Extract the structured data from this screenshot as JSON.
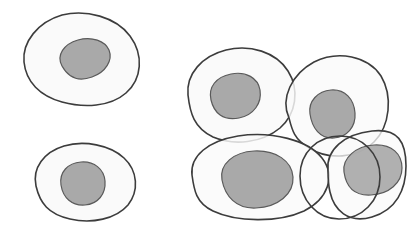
{
  "figure": {
    "background_color": "#ffffff",
    "width": 411,
    "height": 228
  },
  "style": {
    "membrane_stroke": "#3c3c3c",
    "membrane_stroke_width": 1.6,
    "cytoplasm_fill": "#fafafa",
    "nucleus_fill": "#a9a9a9",
    "nucleus_stroke": "#5a5a5a",
    "nucleus_stroke_width": 1.2
  },
  "groups": [
    {
      "name": "isolated-cells",
      "label": "Isolated cells",
      "count": 2
    },
    {
      "name": "cell-cluster",
      "label": "Overlapping cell cluster",
      "count": 5
    }
  ],
  "cells": [
    {
      "id": "cell-1",
      "group": "isolated-cells",
      "label": "Upper left cell",
      "membrane_path": "M 24 62 C 22 42 38 22 62 15 C 86 9 116 17 130 36 C 144 55 142 79 126 93 C 110 107 84 108 62 102 C 40 96 26 82 24 62 Z",
      "nucleus_path": "M 62 66 C 56 55 64 44 78 40 C 92 36 105 41 109 50 C 113 60 106 72 92 77 C 78 82 68 77 62 66 Z",
      "nucleus_shape": "tilted-ellipse"
    },
    {
      "id": "cell-2",
      "group": "isolated-cells",
      "label": "Lower left cell",
      "membrane_path": "M 36 186 C 32 168 44 152 64 146 C 84 140 110 145 124 158 C 138 171 139 191 128 205 C 116 219 92 224 70 219 C 48 214 40 203 36 186 Z",
      "nucleus_path": "M 61 185 C 59 172 68 163 81 162 C 94 161 104 169 105 181 C 106 194 98 204 85 205 C 72 206 63 198 61 185 Z",
      "nucleus_shape": "round"
    },
    {
      "id": "cell-3",
      "group": "cell-cluster",
      "label": "Cluster upper left cell",
      "membrane_path": "M 188 95 C 186 74 202 56 226 50 C 250 44 276 52 288 71 C 300 90 296 114 280 128 C 262 143 234 146 213 137 C 194 128 190 113 188 95 Z",
      "nucleus_path": "M 211 100 C 208 87 216 77 231 74 C 246 71 258 78 260 90 C 262 103 254 115 239 118 C 223 121 214 113 211 100 Z",
      "nucleus_shape": "rounded-square"
    },
    {
      "id": "cell-4",
      "group": "cell-cluster",
      "label": "Cluster upper right cell",
      "membrane_path": "M 289 118 C 280 98 292 74 314 62 C 338 50 368 56 381 76 C 393 96 390 126 374 142 C 357 159 328 160 309 148 C 294 139 292 130 289 118 Z",
      "nucleus_path": "M 310 114 C 308 101 318 91 331 90 C 345 89 354 99 355 113 C 356 127 347 137 334 138 C 320 139 312 128 310 114 Z",
      "nucleus_shape": "tilted-ellipse"
    },
    {
      "id": "cell-5",
      "group": "cell-cluster",
      "label": "Cluster lower left cell",
      "membrane_path": "M 192 175 C 190 156 208 141 238 136 C 272 131 308 140 322 158 C 336 176 328 199 304 211 C 278 223 236 222 213 211 C 196 203 194 190 192 175 Z",
      "nucleus_path": "M 222 180 C 219 164 234 152 254 151 C 276 150 292 161 293 177 C 294 194 278 207 256 208 C 236 209 225 196 222 180 Z",
      "nucleus_shape": "tilted-ellipse"
    },
    {
      "id": "cell-6",
      "group": "cell-cluster",
      "label": "Cluster lower right large cell",
      "membrane_path": "M 328 170 C 326 150 344 134 372 131 C 398 128 406 142 406 166 C 406 190 396 210 372 217 C 348 224 334 210 330 192 C 328 184 328 177 328 170 Z",
      "nucleus_path": "M 344 172 C 342 158 356 146 374 145 C 392 144 402 154 402 168 C 402 183 389 194 371 195 C 354 196 346 186 344 172 Z",
      "nucleus_shape": "tilted-ellipse"
    },
    {
      "id": "cell-7",
      "group": "cell-cluster",
      "label": "Cluster lower middle circular cell",
      "membrane_path": "M 300 176 C 300 152 318 136 340 136 C 362 136 380 153 380 177 C 380 201 362 219 339 219 C 317 219 300 200 300 176 Z",
      "nucleus_shape": "none"
    }
  ]
}
